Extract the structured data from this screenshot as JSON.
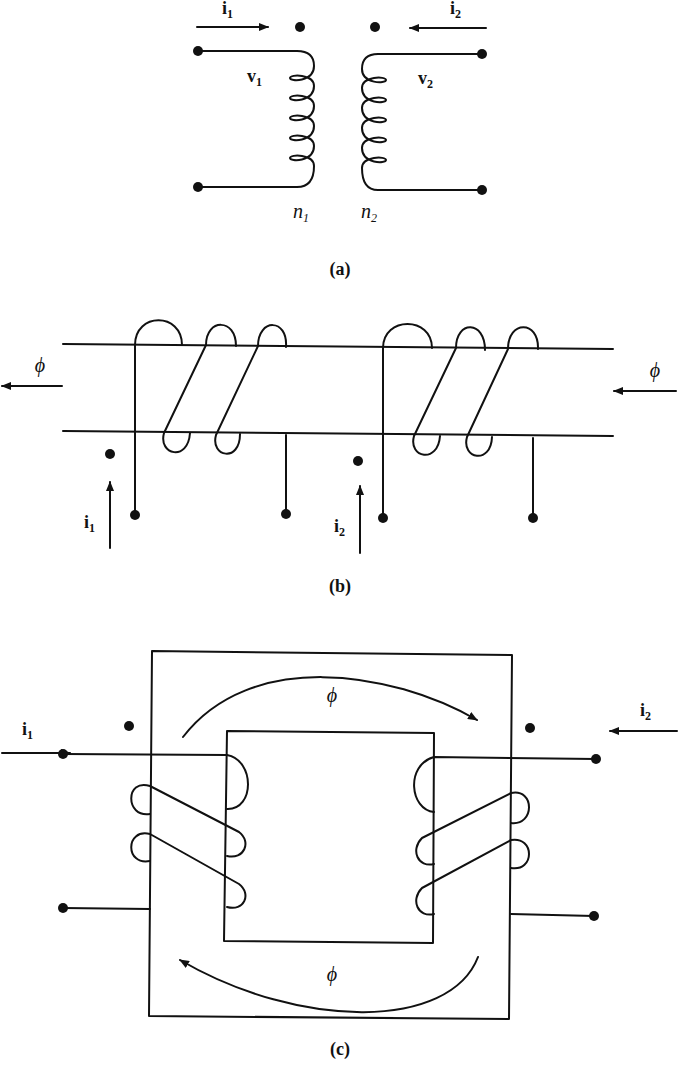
{
  "figure": {
    "panel_a": {
      "caption": "(a)",
      "current_1": {
        "symbol": "i",
        "sub": "1"
      },
      "current_2": {
        "symbol": "i",
        "sub": "2"
      },
      "voltage_1": {
        "symbol": "v",
        "sub": "1"
      },
      "voltage_2": {
        "symbol": "v",
        "sub": "2"
      },
      "turns_1": {
        "symbol": "n",
        "sub": "1"
      },
      "turns_2": {
        "symbol": "n",
        "sub": "2"
      }
    },
    "panel_b": {
      "caption": "(b)",
      "flux_left": "ϕ",
      "flux_right": "ϕ",
      "current_1": {
        "symbol": "i",
        "sub": "1"
      },
      "current_2": {
        "symbol": "i",
        "sub": "2"
      }
    },
    "panel_c": {
      "caption": "(c)",
      "flux_top": "ϕ",
      "flux_bottom": "ϕ",
      "current_1": {
        "symbol": "i",
        "sub": "1"
      },
      "current_2": {
        "symbol": "i",
        "sub": "2"
      }
    }
  }
}
